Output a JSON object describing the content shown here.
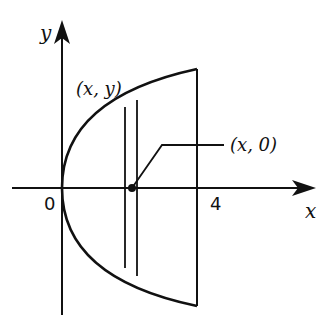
{
  "diagram": {
    "axis_x_label": "x",
    "axis_y_label": "y",
    "origin_label": "0",
    "tick_x_label": "4",
    "curve_point_label": "(x, y)",
    "axis_point_label": "(x, 0)",
    "stroke_color": "#111111",
    "background": "#ffffff"
  }
}
